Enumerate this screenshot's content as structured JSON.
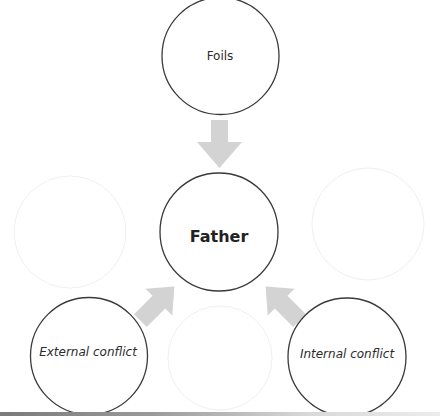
{
  "diagram": {
    "type": "concept-map",
    "center_node": {
      "label": "Father",
      "style": "bold"
    },
    "nodes": [
      {
        "id": "foils",
        "label": "Foils",
        "style": "regular",
        "position": "top"
      },
      {
        "id": "father",
        "label": "Father",
        "style": "bold",
        "position": "center"
      },
      {
        "id": "external",
        "label": "External conflict",
        "style": "italic",
        "position": "bottom-left"
      },
      {
        "id": "internal",
        "label": "Internal conflict",
        "style": "italic",
        "position": "bottom-right"
      }
    ],
    "edges": [
      {
        "from": "foils",
        "to": "father",
        "direction": "down"
      },
      {
        "from": "external",
        "to": "father",
        "direction": "up-right"
      },
      {
        "from": "internal",
        "to": "father",
        "direction": "up-left"
      }
    ],
    "colors": {
      "circle_stroke": "#3a3a3a",
      "arrow_fill": "#d3d3d3",
      "ghost_stroke": "#f0f0f0",
      "background": "#ffffff"
    }
  }
}
